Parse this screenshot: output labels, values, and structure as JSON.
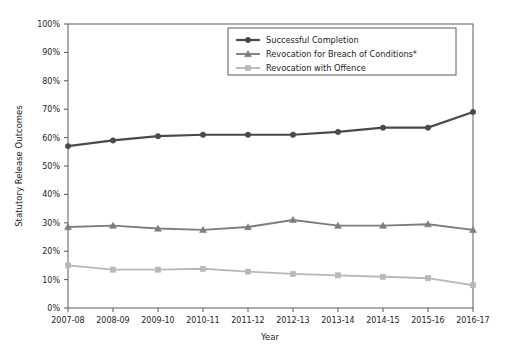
{
  "chart_data": {
    "type": "line",
    "title": "",
    "xlabel": "Year",
    "ylabel": "Statutory Release Outcomes",
    "categories": [
      "2007-08",
      "2008-09",
      "2009-10",
      "2010-11",
      "2011-12",
      "2012-13",
      "2013-14",
      "2014-15",
      "2015-16",
      "2016-17"
    ],
    "ylim": [
      0,
      100
    ],
    "ytick_labels": [
      "0%",
      "10%",
      "20%",
      "30%",
      "40%",
      "50%",
      "60%",
      "70%",
      "80%",
      "90%",
      "100%"
    ],
    "ytick_values": [
      0,
      10,
      20,
      30,
      40,
      50,
      60,
      70,
      80,
      90,
      100
    ],
    "grid": false,
    "legend_position": "top-center-right",
    "series": [
      {
        "name": "Successful Completion",
        "color": "#4a4a4a",
        "marker": "circle",
        "values": [
          57,
          59,
          60.5,
          61,
          61,
          61,
          62,
          63.5,
          63.5,
          69
        ]
      },
      {
        "name": "Revocation for Breach of Conditions*",
        "color": "#7d7d7d",
        "marker": "triangle",
        "values": [
          28.5,
          29,
          28,
          27.5,
          28.5,
          31,
          29,
          29,
          29.5,
          27.5
        ]
      },
      {
        "name": "Revocation with Offence",
        "color": "#b8b8b8",
        "marker": "square",
        "values": [
          15,
          13.5,
          13.5,
          13.8,
          12.8,
          12,
          11.5,
          11,
          10.5,
          8
        ]
      }
    ]
  },
  "axes": {
    "x_title": "Year",
    "y_title": "Statutory Release Outcomes"
  },
  "legend": {
    "items": [
      {
        "label": "Successful Completion"
      },
      {
        "label": "Revocation for Breach of Conditions*"
      },
      {
        "label": "Revocation with Offence"
      }
    ]
  },
  "colors": {
    "series1": "#4a4a4a",
    "series2": "#7d7d7d",
    "series3": "#b8b8b8",
    "axis": "#555555",
    "background": "#ffffff"
  }
}
